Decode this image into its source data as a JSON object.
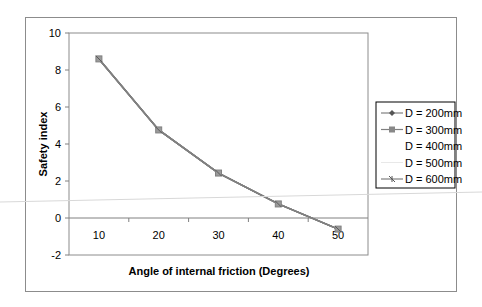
{
  "chart_data": {
    "type": "line",
    "title": "",
    "xlabel": "Angle of internal friction (Degrees)",
    "ylabel": "Safety index",
    "categories": [
      "10",
      "20",
      "30",
      "40",
      "50"
    ],
    "x": [
      10,
      20,
      30,
      40,
      50
    ],
    "ylim": [
      -2,
      10
    ],
    "yticks": [
      -2,
      0,
      2,
      4,
      6,
      8,
      10
    ],
    "grid": false,
    "legend_position": "right",
    "series": [
      {
        "name": "D = 200mm",
        "marker": "diamond",
        "values": [
          8.6,
          4.76,
          2.43,
          0.76,
          -0.6
        ]
      },
      {
        "name": "D = 300mm",
        "marker": "square",
        "values": [
          8.6,
          4.76,
          2.43,
          0.76,
          -0.6
        ]
      },
      {
        "name": "D = 400mm",
        "marker": "none",
        "values": [
          8.6,
          4.76,
          2.43,
          0.76,
          -0.6
        ]
      },
      {
        "name": "D = 500mm",
        "marker": "none",
        "values": [
          8.6,
          4.76,
          2.43,
          0.76,
          -0.6
        ]
      },
      {
        "name": "D = 600mm",
        "marker": "cross",
        "values": [
          8.6,
          4.76,
          2.43,
          0.76,
          -0.6
        ]
      }
    ]
  },
  "colors": {
    "line": "#808080",
    "frame": "#8c8c8c",
    "axis": "#808080"
  }
}
